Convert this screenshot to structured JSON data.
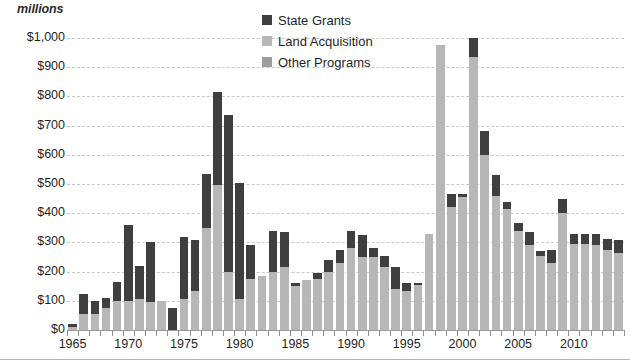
{
  "chart_data": {
    "type": "bar",
    "stacked": true,
    "title": "",
    "subtitle": "",
    "unit_caption": "millions",
    "xlabel": "",
    "ylabel": "millions",
    "ylim": [
      0,
      1000
    ],
    "ytick_step": 100,
    "grid": true,
    "legend_position": "top-center",
    "ytick_labels": [
      "$1,000",
      "$900",
      "$800",
      "$700",
      "$600",
      "$500",
      "$400",
      "$300",
      "$200",
      "$100",
      "$0"
    ],
    "ytick_values": [
      1000,
      900,
      800,
      700,
      600,
      500,
      400,
      300,
      200,
      100,
      0
    ],
    "xtick_labels": [
      "1965",
      "1970",
      "1975",
      "1980",
      "1985",
      "1990",
      "1995",
      "2000",
      "2005",
      "2010"
    ],
    "xtick_values": [
      1965,
      1970,
      1975,
      1980,
      1985,
      1990,
      1995,
      2000,
      2005,
      2010
    ],
    "categories": [
      1965,
      1966,
      1967,
      1968,
      1969,
      1970,
      1971,
      1972,
      1973,
      1974,
      1975,
      1976,
      1977,
      1978,
      1979,
      1980,
      1981,
      1982,
      1983,
      1984,
      1985,
      1986,
      1987,
      1988,
      1989,
      1990,
      1991,
      1992,
      1993,
      1994,
      1995,
      1996,
      1997,
      1998,
      1999,
      2000,
      2001,
      2002,
      2003,
      2004,
      2005,
      2006,
      2007,
      2008,
      2009,
      2010,
      2011,
      2012,
      2013,
      2014
    ],
    "colors": {
      "state_grants": "#3f3f3f",
      "land_acquisition": "#b7b7b7",
      "other_programs": "#9d9d9d",
      "gridline": "#c9c9c9",
      "axis": "#9a9a9a",
      "text": "#1f1f1f",
      "background": "#ffffff"
    },
    "series": [
      {
        "name": "Other Programs",
        "key": "other_programs",
        "color": "#9d9d9d",
        "values": [
          0,
          0,
          0,
          0,
          0,
          0,
          0,
          0,
          0,
          0,
          0,
          0,
          0,
          0,
          0,
          0,
          0,
          0,
          0,
          0,
          0,
          0,
          0,
          0,
          0,
          0,
          0,
          0,
          0,
          0,
          0,
          0,
          0,
          0,
          0,
          0,
          0,
          0,
          0,
          0,
          0,
          0,
          0,
          0,
          0,
          0,
          0,
          0,
          0,
          0
        ]
      },
      {
        "name": "Land Acquisition",
        "key": "land_acquisition",
        "color": "#b7b7b7",
        "values": [
          10,
          55,
          55,
          75,
          100,
          100,
          105,
          95,
          100,
          0,
          105,
          135,
          350,
          495,
          200,
          105,
          175,
          185,
          200,
          215,
          150,
          170,
          175,
          200,
          230,
          280,
          250,
          250,
          215,
          140,
          135,
          155,
          330,
          975,
          420,
          455,
          935,
          600,
          460,
          415,
          340,
          290,
          255,
          230,
          400,
          295,
          295,
          290,
          275,
          265
        ]
      },
      {
        "name": "State Grants",
        "key": "state_grants",
        "color": "#3f3f3f",
        "values": [
          10,
          70,
          45,
          35,
          65,
          260,
          115,
          205,
          0,
          75,
          215,
          175,
          185,
          320,
          535,
          400,
          115,
          0,
          140,
          120,
          10,
          0,
          20,
          40,
          45,
          60,
          75,
          30,
          40,
          75,
          25,
          5,
          0,
          0,
          45,
          10,
          65,
          80,
          70,
          25,
          25,
          45,
          15,
          45,
          50,
          35,
          35,
          40,
          35,
          45
        ]
      }
    ],
    "totals": [
      20,
      125,
      100,
      110,
      165,
      360,
      220,
      300,
      100,
      75,
      320,
      310,
      535,
      815,
      735,
      505,
      290,
      185,
      340,
      335,
      160,
      170,
      195,
      240,
      275,
      340,
      325,
      280,
      255,
      215,
      160,
      160,
      330,
      975,
      465,
      465,
      1000,
      680,
      530,
      440,
      365,
      335,
      270,
      275,
      450,
      330,
      330,
      330,
      310,
      310
    ]
  },
  "legend": {
    "items": [
      {
        "label": "State Grants",
        "swatch_class": "sw-state"
      },
      {
        "label": "Land Acquisition",
        "swatch_class": "sw-land"
      },
      {
        "label": "Other Programs",
        "swatch_class": "sw-other"
      }
    ]
  }
}
